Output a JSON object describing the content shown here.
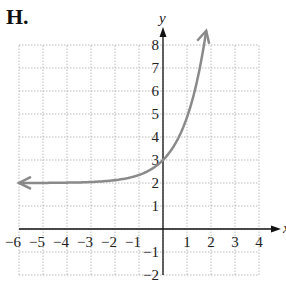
{
  "figure_label": "H.",
  "chart_data": {
    "type": "line",
    "title": "",
    "xlabel": "x",
    "ylabel": "y",
    "xlim": [
      -6,
      4
    ],
    "ylim": [
      -2,
      8
    ],
    "grid": true,
    "x_ticks": [
      "−6",
      "−5",
      "−4",
      "−3",
      "−2",
      "−1",
      "1",
      "2",
      "3",
      "4"
    ],
    "y_ticks": [
      "−2",
      "−1",
      "1",
      "2",
      "3",
      "4",
      "5",
      "6",
      "7",
      "8"
    ],
    "series": [
      {
        "name": "curve",
        "color": "#8a8a8a",
        "arrows": "both",
        "x": [
          -6,
          -4,
          -2,
          -1,
          0,
          0.5,
          1,
          1.5,
          1.8
        ],
        "y": [
          2.0,
          2.02,
          2.15,
          2.4,
          3.0,
          3.7,
          4.8,
          6.6,
          8.0
        ]
      }
    ],
    "horizontal_asymptote": 2
  }
}
